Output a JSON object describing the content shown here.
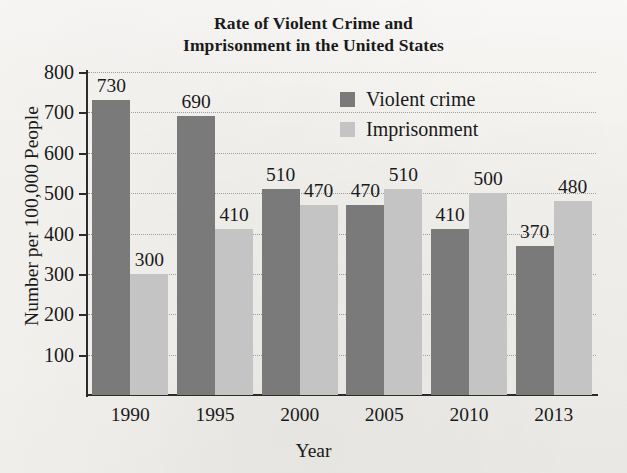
{
  "chart_data": {
    "type": "bar",
    "title": "Rate of Violent Crime and Imprisonment in the United States",
    "title_line1": "Rate of Violent Crime and",
    "title_line2": "Imprisonment in the United States",
    "xlabel": "Year",
    "ylabel": "Number per 100,000 People",
    "categories": [
      "1990",
      "1995",
      "2000",
      "2005",
      "2010",
      "2013"
    ],
    "series": [
      {
        "name": "Violent crime",
        "color": "#7a7a7a",
        "values": [
          730,
          690,
          510,
          470,
          410,
          370
        ]
      },
      {
        "name": "Imprisonment",
        "color": "#c4c4c4",
        "values": [
          300,
          410,
          470,
          510,
          500,
          480
        ]
      }
    ],
    "ylim": [
      0,
      800
    ],
    "ytick_labels": [
      "800",
      "700",
      "600",
      "500",
      "400",
      "300",
      "200",
      "100"
    ],
    "ytick_values": [
      800,
      700,
      600,
      500,
      400,
      300,
      200,
      100
    ],
    "grid": true,
    "grid_style": "dotted-horizontal",
    "legend_position": "top-right-inside",
    "data_labels": true
  },
  "legend": {
    "items": [
      {
        "label": "Violent crime",
        "color": "#7a7a7a"
      },
      {
        "label": "Imprisonment",
        "color": "#c4c4c4"
      }
    ]
  },
  "colors": {
    "violent_crime": "#7a7a7a",
    "imprisonment": "#c4c4c4",
    "axis": "#2b2b2b",
    "gridline": "#9e9e9e",
    "background": "#f7f6f3"
  }
}
